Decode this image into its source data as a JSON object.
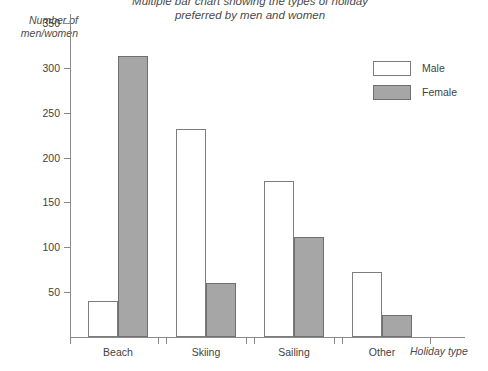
{
  "chart_data": {
    "type": "bar",
    "title": "Multiple bar chart showing the types of holiday\npreferred by men and women",
    "xlabel": "Holiday type",
    "ylabel": "Number of\nmen/women",
    "categories": [
      "Beach",
      "Skiing",
      "Sailing",
      "Other"
    ],
    "series": [
      {
        "name": "Male",
        "values": [
          40,
          232,
          174,
          72
        ],
        "color": "#ffffff",
        "border": "#7d7d7d"
      },
      {
        "name": "Female",
        "values": [
          313,
          60,
          111,
          25
        ],
        "color": "#a6a6a6",
        "border": "#6f6f6f"
      }
    ],
    "ylim": [
      0,
      360
    ],
    "yticks": [
      50,
      100,
      150,
      200,
      250,
      300,
      350
    ],
    "ytick_labels": [
      "50",
      "100",
      "150",
      "200",
      "250",
      "300",
      "350"
    ],
    "grid": false,
    "legend_position": "top-right"
  },
  "legend": {
    "entries": [
      {
        "label": "Male"
      },
      {
        "label": "Female"
      }
    ]
  }
}
